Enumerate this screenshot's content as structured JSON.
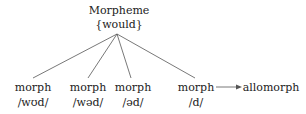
{
  "root": {
    "label": "Morpheme",
    "value": "{would}"
  },
  "morphs": [
    {
      "label": "morph",
      "form": "/wʊd/"
    },
    {
      "label": "morph",
      "form": "/wəd/"
    },
    {
      "label": "morph",
      "form": "/əd/"
    },
    {
      "label": "morph",
      "form": "/d/"
    }
  ],
  "arrow_target": "allomorph",
  "colors": {
    "line": "#555555",
    "text": "#222222"
  }
}
